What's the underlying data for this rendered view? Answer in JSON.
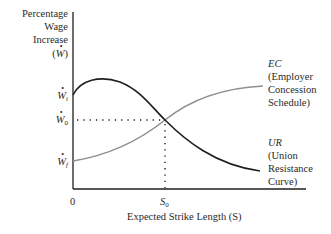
{
  "y_axis": {
    "title_lines": [
      "Percentage",
      "Wage",
      "Increase",
      "(W)"
    ],
    "ticks": [
      {
        "symbol": "W",
        "subscript": "i",
        "y": 95
      },
      {
        "symbol": "W",
        "subscript": "0",
        "y": 120
      },
      {
        "symbol": "W",
        "subscript": "f",
        "y": 161
      }
    ]
  },
  "x_axis": {
    "title": "Expected Strike Length (S)",
    "ticks": [
      {
        "label": "0",
        "x": 73
      },
      {
        "label": "S",
        "subscript": "0",
        "x": 165
      }
    ]
  },
  "curves": {
    "ec": {
      "abbr": "EC",
      "lines": [
        "(Employer",
        "Concession",
        "Schedule)"
      ],
      "color": "#8f8f8f"
    },
    "ur": {
      "abbr": "UR",
      "lines": [
        "(Union",
        "Resistance",
        "Curve)"
      ],
      "color": "#1e1e1e"
    }
  },
  "equilibrium": {
    "x_label": "S0",
    "y_label": "W0"
  }
}
